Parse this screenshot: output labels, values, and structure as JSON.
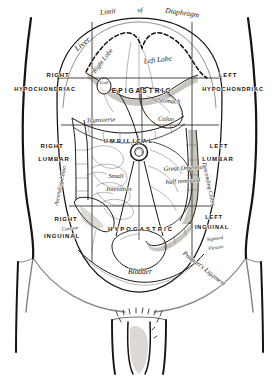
{
  "plate": {
    "title": "Abdominal Regions",
    "description": "Anterior view of the abdomen showing the nine topographic regions with underlying viscera"
  },
  "top_annotation": {
    "limit": "Limit",
    "of": "of",
    "diaphragm": "Diaphragm"
  },
  "regions": [
    {
      "id": "right-hypochondriac",
      "line1": "RIGHT",
      "line2": "HYPOCHONDRIAC"
    },
    {
      "id": "epigastric",
      "line1": "EPIGASTRIC",
      "line2": ""
    },
    {
      "id": "left-hypochondriac",
      "line1": "LEFT",
      "line2": "HYPOCHONDRIAC"
    },
    {
      "id": "right-lumbar",
      "line1": "RIGHT",
      "line2": "LUMBAR"
    },
    {
      "id": "umbilical",
      "line1": "UMBILICAL",
      "line2": ""
    },
    {
      "id": "left-lumbar",
      "line1": "LEFT",
      "line2": "LUMBAR"
    },
    {
      "id": "right-inguinal",
      "line1": "RIGHT",
      "line2": "INGUINAL"
    },
    {
      "id": "hypogastric",
      "line1": "HYPOGASTRIC",
      "line2": ""
    },
    {
      "id": "left-inguinal",
      "line1": "LEFT",
      "line2": "INGUINAL"
    }
  ],
  "organs": {
    "liver": "Liver",
    "right_lobe": "Right Lobe",
    "left_lobe": "Left Lobe",
    "gall_bladder": "Gall",
    "stomach": "Stomach",
    "transverse": "Transverse",
    "colon": "Colon",
    "great_omentum_line1": "Great Omentum",
    "great_omentum_line2": "half removed",
    "small_line1": "Small",
    "small_line2": "Intestines",
    "ascending_colon": "Ascending Colon",
    "descending_colon": "Descending Colon",
    "caecum": "Caecum",
    "sigmoid_line1": "Sigmoid",
    "sigmoid_line2": "Flexure",
    "bladder": "Bladder",
    "pouparts_ligament": "Poupart's Ligament"
  },
  "colors": {
    "ink": "#17120d",
    "paper": "#ffffff",
    "grid": "#2a241c",
    "shadow": "#6e6354"
  }
}
